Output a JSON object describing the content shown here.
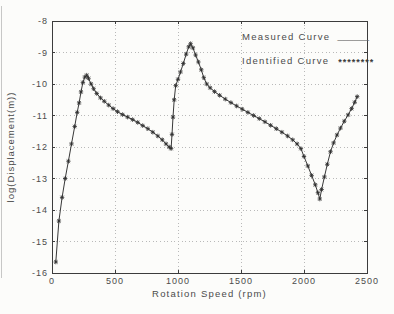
{
  "figure": {
    "xaxis_label": "Rotation Speed (rpm)",
    "yaxis_label": "log(Displacement(m))"
  },
  "legend": {
    "measured": {
      "label": "Measured Curve",
      "sample": "______"
    },
    "identified": {
      "label": "Identified Curve",
      "sample": "********"
    }
  },
  "colors": {
    "axis": "#3c3c3c",
    "grid": "#b9b9b9",
    "curve": "#383838",
    "marker": "#2e2e2e",
    "text": "#4b4b4b",
    "background": "#fcfcfa"
  },
  "chart_data": {
    "type": "line",
    "title": "",
    "xlabel": "Rotation Speed (rpm)",
    "ylabel": "log(Displacement(m))",
    "xlim": [
      0,
      2500
    ],
    "ylim": [
      -16,
      -8
    ],
    "xticks": [
      0,
      500,
      1000,
      1500,
      2000,
      2500
    ],
    "yticks": [
      -8,
      -9,
      -10,
      -11,
      -12,
      -13,
      -14,
      -15,
      -16
    ],
    "grid": "dotted",
    "legend_position": "top-right",
    "series": [
      {
        "name": "Measured Curve",
        "render": "line"
      },
      {
        "name": "Identified Curve",
        "render": "markers"
      }
    ],
    "x": [
      30,
      55,
      80,
      105,
      130,
      155,
      180,
      200,
      215,
      230,
      245,
      260,
      275,
      290,
      310,
      330,
      355,
      385,
      415,
      450,
      485,
      520,
      560,
      600,
      640,
      680,
      720,
      760,
      800,
      840,
      875,
      905,
      930,
      945,
      952,
      960,
      970,
      982,
      1000,
      1020,
      1042,
      1065,
      1085,
      1100,
      1118,
      1140,
      1162,
      1185,
      1205,
      1228,
      1255,
      1290,
      1330,
      1375,
      1420,
      1465,
      1510,
      1555,
      1600,
      1645,
      1690,
      1735,
      1780,
      1825,
      1870,
      1910,
      1945,
      1975,
      2000,
      2030,
      2060,
      2090,
      2110,
      2125,
      2140,
      2162,
      2185,
      2210,
      2235,
      2262,
      2290,
      2320,
      2350,
      2378,
      2402,
      2422
    ],
    "y": [
      -15.65,
      -14.35,
      -13.6,
      -13.0,
      -12.45,
      -11.9,
      -11.35,
      -10.9,
      -10.6,
      -10.25,
      -9.95,
      -9.78,
      -9.72,
      -9.82,
      -10.0,
      -10.15,
      -10.3,
      -10.44,
      -10.55,
      -10.67,
      -10.78,
      -10.88,
      -10.97,
      -11.05,
      -11.13,
      -11.22,
      -11.32,
      -11.42,
      -11.53,
      -11.65,
      -11.77,
      -11.9,
      -12.0,
      -12.05,
      -11.6,
      -11.05,
      -10.5,
      -10.05,
      -9.85,
      -9.62,
      -9.35,
      -9.05,
      -8.82,
      -8.72,
      -8.85,
      -9.08,
      -9.3,
      -9.55,
      -9.8,
      -10.0,
      -10.12,
      -10.24,
      -10.36,
      -10.48,
      -10.59,
      -10.7,
      -10.8,
      -10.9,
      -11.0,
      -11.1,
      -11.2,
      -11.31,
      -11.42,
      -11.53,
      -11.65,
      -11.77,
      -11.9,
      -12.05,
      -12.3,
      -12.6,
      -12.9,
      -13.2,
      -13.45,
      -13.65,
      -13.35,
      -12.95,
      -12.55,
      -12.15,
      -11.87,
      -11.62,
      -11.4,
      -11.18,
      -10.98,
      -10.78,
      -10.58,
      -10.4
    ]
  },
  "plot_box": {
    "left": 52,
    "top": 21,
    "right": 367,
    "bottom": 273
  }
}
